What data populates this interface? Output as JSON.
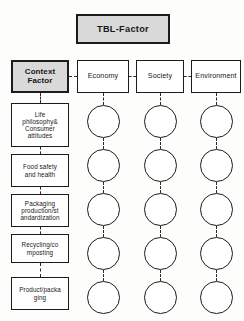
{
  "diagram": {
    "title_box": {
      "label": "TBL-Factor"
    },
    "header_row": [
      {
        "label": "Context\nFactor",
        "shaded": true,
        "name": "context-factor-box"
      },
      {
        "label": "Economy",
        "shaded": false,
        "name": "economy-box"
      },
      {
        "label": "Society",
        "shaded": false,
        "name": "society-box"
      },
      {
        "label": "Environment",
        "shaded": false,
        "name": "environment-box"
      }
    ],
    "context_items": [
      {
        "label": "Life\nphilosophy&\nConsumer\nattitudes",
        "name": "life-philosophy-consumer-attitudes-box"
      },
      {
        "label": "Food safety\nand health",
        "name": "food-safety-and-health-box"
      },
      {
        "label": "Packaging\nproduction/st\nandardization",
        "name": "packaging-production-standardization-box"
      },
      {
        "label": "Recycling/co\nmposting",
        "name": "recycling-composting-box"
      },
      {
        "label": "Product/packa\nging",
        "name": "product-packaging-box"
      }
    ],
    "matrix": {
      "columns": [
        "Economy",
        "Society",
        "Environment"
      ],
      "rows": [
        "Life philosophy& Consumer attitudes",
        "Food safety and health",
        "Packaging production/standardization",
        "Recycling/composting",
        "Product/packaging"
      ],
      "cell_marker": "circle",
      "cell_count": 15
    },
    "colors": {
      "shaded_fill": "#d9d9d9",
      "box_fill": "#ffffff",
      "stroke": "#1b1b1b",
      "connector": "#2a2a2a",
      "background": "#fdfdfb"
    }
  }
}
